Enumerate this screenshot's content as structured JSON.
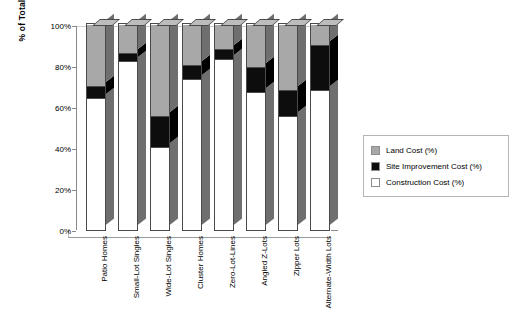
{
  "chart_data": {
    "type": "bar",
    "subtype": "stacked-100-3d",
    "title": "",
    "xlabel": "",
    "ylabel": "% of Total Costs",
    "ylim": [
      0,
      100
    ],
    "ytick_labels": [
      "0%",
      "20%",
      "40%",
      "60%",
      "80%",
      "100%"
    ],
    "ytick_values": [
      0,
      20,
      40,
      60,
      80,
      100
    ],
    "grid": false,
    "legend_position": "right",
    "categories": [
      "Patio Homes",
      "Small-Lot Singles",
      "Wide-Lot Singles",
      "Cluster Homes",
      "Zero-Lot-Lines",
      "Angled Z-Lots",
      "Zipper Lots",
      "Alternate-Width Lots"
    ],
    "series": [
      {
        "name": "Construction Cost (%)",
        "color": "#ffffff",
        "values": [
          64,
          82,
          40,
          73,
          83,
          67,
          55,
          68
        ]
      },
      {
        "name": "Site Improvement Cost (%)",
        "color": "#0d0d0d",
        "values": [
          6,
          4,
          15,
          7,
          5,
          12,
          13,
          22
        ]
      },
      {
        "name": "Land Cost (%)",
        "color": "#a8a8a8",
        "values": [
          30,
          14,
          45,
          20,
          12,
          21,
          32,
          10
        ]
      }
    ],
    "legend_entries": [
      {
        "label": "Land Cost (%)",
        "color": "#a8a8a8"
      },
      {
        "label": "Site Improvement Cost (%)",
        "color": "#0d0d0d"
      },
      {
        "label": "Construction Cost (%)",
        "color": "#ffffff"
      }
    ]
  }
}
